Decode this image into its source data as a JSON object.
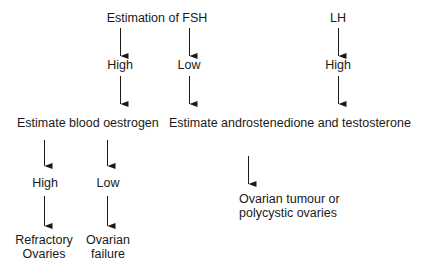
{
  "flowchart": {
    "nodes": {
      "fsh": "Estimation of FSH",
      "lh": "LH",
      "fsh_high": "High",
      "fsh_low": "Low",
      "lh_high": "High",
      "oestrogen": "Estimate blood oestrogen",
      "androgens": "Estimate androstenedione and testosterone",
      "oestrogen_high": "High",
      "oestrogen_low": "Low",
      "refractory_line1": "Refractory",
      "refractory_line2": "Ovaries",
      "failure_line1": "Ovarian",
      "failure_line2": "failure",
      "tumour_line1": "Ovarian tumour or",
      "tumour_line2": "polycystic ovaries"
    },
    "edges": [
      {
        "from": "Estimation of FSH",
        "to": "High"
      },
      {
        "from": "Estimation of FSH",
        "to": "Low"
      },
      {
        "from": "LH",
        "to": "High"
      },
      {
        "from": "High (FSH)",
        "to": "Estimate blood oestrogen"
      },
      {
        "from": "Low (FSH)",
        "to": "Estimate androstenedione and testosterone"
      },
      {
        "from": "High (LH)",
        "to": "Estimate androstenedione and testosterone"
      },
      {
        "from": "Estimate blood oestrogen",
        "to": "High"
      },
      {
        "from": "Estimate blood oestrogen",
        "to": "Low"
      },
      {
        "from": "High (oestrogen)",
        "to": "Refractory Ovaries"
      },
      {
        "from": "Low (oestrogen)",
        "to": "Ovarian failure"
      },
      {
        "from": "Estimate androstenedione and testosterone",
        "to": "Ovarian tumour or polycystic ovaries"
      }
    ],
    "colors": {
      "text": "#1a1a1a",
      "arrow": "#1a1a1a",
      "background": "#ffffff"
    }
  }
}
